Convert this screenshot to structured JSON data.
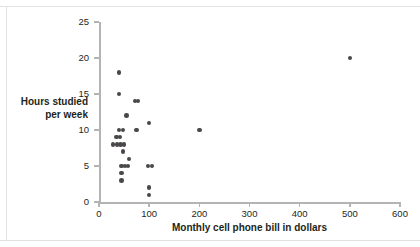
{
  "chart_data": {
    "type": "scatter",
    "title": "",
    "xlabel": "Monthly cell phone bill in dollars",
    "ylabel_line1": "Hours studied",
    "ylabel_line2": "per week",
    "xlim": [
      0,
      600
    ],
    "ylim": [
      0,
      25
    ],
    "xticks": [
      0,
      100,
      200,
      300,
      400,
      500,
      600
    ],
    "yticks": [
      0,
      5,
      10,
      15,
      20,
      25
    ],
    "xticklabels": [
      "0",
      "100",
      "200",
      "300",
      "400",
      "500",
      "600"
    ],
    "yticklabels": [
      "0",
      "5",
      "10",
      "15",
      "20",
      "25"
    ],
    "grid": false,
    "legend": null,
    "marker_color": "#4a474a",
    "axis_color": "#b4b4b4",
    "points": [
      {
        "x": 40,
        "y": 18
      },
      {
        "x": 40,
        "y": 15
      },
      {
        "x": 72,
        "y": 14
      },
      {
        "x": 78,
        "y": 14
      },
      {
        "x": 55,
        "y": 12
      },
      {
        "x": 100,
        "y": 11
      },
      {
        "x": 40,
        "y": 10
      },
      {
        "x": 48,
        "y": 10
      },
      {
        "x": 75,
        "y": 10
      },
      {
        "x": 200,
        "y": 10
      },
      {
        "x": 35,
        "y": 9
      },
      {
        "x": 42,
        "y": 9
      },
      {
        "x": 28,
        "y": 8
      },
      {
        "x": 36,
        "y": 8
      },
      {
        "x": 43,
        "y": 8
      },
      {
        "x": 50,
        "y": 8
      },
      {
        "x": 48,
        "y": 7
      },
      {
        "x": 60,
        "y": 6
      },
      {
        "x": 45,
        "y": 5
      },
      {
        "x": 52,
        "y": 5
      },
      {
        "x": 58,
        "y": 5
      },
      {
        "x": 98,
        "y": 5
      },
      {
        "x": 106,
        "y": 5
      },
      {
        "x": 45,
        "y": 4
      },
      {
        "x": 45,
        "y": 3
      },
      {
        "x": 100,
        "y": 2
      },
      {
        "x": 100,
        "y": 1
      },
      {
        "x": 500,
        "y": 20
      }
    ]
  }
}
